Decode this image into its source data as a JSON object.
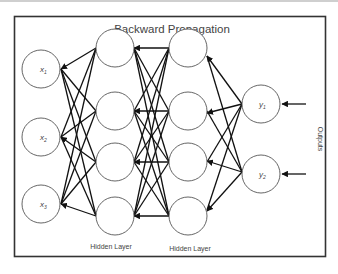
{
  "title": "Backward Propagation",
  "layers": {
    "input": {
      "nodes": [
        "x",
        "x",
        "x"
      ],
      "subscripts": [
        "1",
        "2",
        "3"
      ]
    },
    "hidden1": {
      "label": "Hidden Layer",
      "count": 4
    },
    "hidden2": {
      "label": "Hidden Layer",
      "count": 4
    },
    "output": {
      "nodes": [
        "y",
        "y"
      ],
      "subscripts": [
        "1",
        "2"
      ]
    }
  },
  "outputs_label": "Outputs",
  "colors": {
    "edge": "#111111",
    "node_stroke": "#555555",
    "frame": "#333333",
    "text": "#444444"
  }
}
